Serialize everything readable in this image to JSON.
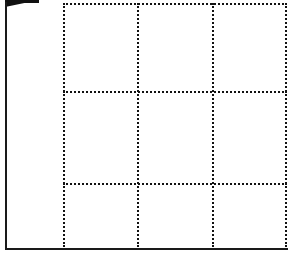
{
  "diagram": {
    "type": "grid",
    "rows": 3,
    "columns": 3,
    "line_style": "dotted",
    "line_color": "#111111",
    "background": "#ffffff",
    "frame": {
      "left_border": "solid",
      "bottom_border": "solid",
      "top_left_wedge": "solid-black"
    },
    "cells": [
      {
        "row": 1,
        "col": 1,
        "label": ""
      },
      {
        "row": 1,
        "col": 2,
        "label": ""
      },
      {
        "row": 1,
        "col": 3,
        "label": ""
      },
      {
        "row": 2,
        "col": 1,
        "label": ""
      },
      {
        "row": 2,
        "col": 2,
        "label": ""
      },
      {
        "row": 2,
        "col": 3,
        "label": ""
      },
      {
        "row": 3,
        "col": 1,
        "label": ""
      },
      {
        "row": 3,
        "col": 2,
        "label": ""
      },
      {
        "row": 3,
        "col": 3,
        "label": ""
      }
    ]
  }
}
